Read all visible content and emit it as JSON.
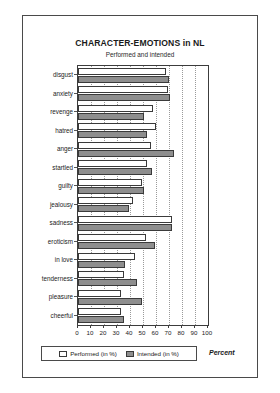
{
  "chart_data": {
    "type": "bar",
    "orientation": "horizontal",
    "title": "CHARACTER-EMOTIONS in NL",
    "subtitle": "Performed and intended",
    "xlabel": "Percent",
    "ylabel": "",
    "xlim": [
      0,
      100
    ],
    "xticks": [
      0,
      10,
      20,
      30,
      40,
      50,
      60,
      70,
      80,
      90,
      100
    ],
    "grid": true,
    "grid_axis": "x",
    "legend_position": "bottom",
    "categories": [
      "disgust",
      "anxiety",
      "revenge",
      "hatred",
      "anger",
      "startled",
      "guilty",
      "jealousy",
      "sadness",
      "eroticism",
      "in love",
      "tenderness",
      "pleasure",
      "cheerful"
    ],
    "series": [
      {
        "name": "Performed (in %)",
        "color": "#ffffff",
        "values": [
          68,
          69,
          58,
          60,
          56,
          53,
          49,
          42,
          72,
          52,
          44,
          35,
          33,
          33
        ]
      },
      {
        "name": "Intended (in %)",
        "color": "#8e8e8e",
        "values": [
          70,
          71,
          51,
          53,
          74,
          57,
          51,
          39,
          72,
          59,
          36,
          45,
          49,
          35
        ]
      }
    ]
  },
  "legend": {
    "items": [
      {
        "label": "Performed (in %)",
        "swatch": "white-bar-swatch"
      },
      {
        "label": "Intended (in %)",
        "swatch": "gray-bar-swatch"
      }
    ]
  },
  "axis": {
    "unit_label": "Percent"
  }
}
